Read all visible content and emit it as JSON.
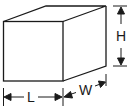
{
  "diagram": {
    "type": "box-dimensions",
    "labels": {
      "length": "L",
      "width": "W",
      "height": "H"
    },
    "colors": {
      "stroke": "#1a1a1a",
      "background": "#ffffff"
    }
  }
}
